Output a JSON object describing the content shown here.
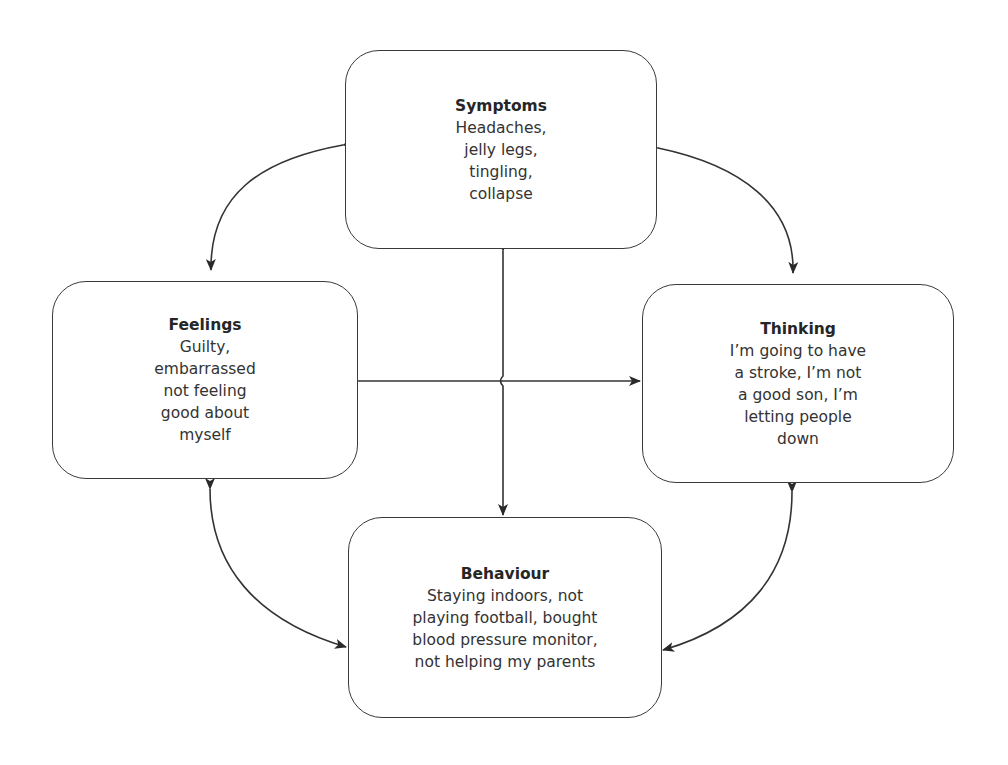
{
  "diagram": {
    "type": "cognitive-behavioural cycle",
    "nodes": [
      {
        "id": "symptoms",
        "title": "Symptoms",
        "body": "Headaches,\njelly legs,\ntingling,\ncollapse"
      },
      {
        "id": "feelings",
        "title": "Feelings",
        "body": "Guilty,\nembarrassed\nnot feeling\ngood about\nmyself"
      },
      {
        "id": "thinking",
        "title": "Thinking",
        "body": "I’m going to have\na stroke, I’m not\na good son, I’m\nletting people\ndown"
      },
      {
        "id": "behaviour",
        "title": "Behaviour",
        "body": "Staying indoors, not\nplaying football, bought\nblood pressure monitor,\nnot helping my parents"
      }
    ],
    "edges": [
      {
        "from": "symptoms",
        "to": "feelings",
        "style": "curved",
        "bidirectional": true
      },
      {
        "from": "symptoms",
        "to": "thinking",
        "style": "curved",
        "bidirectional": true
      },
      {
        "from": "feelings",
        "to": "behaviour",
        "style": "curved",
        "bidirectional": true
      },
      {
        "from": "thinking",
        "to": "behaviour",
        "style": "curved",
        "bidirectional": true
      },
      {
        "from": "symptoms",
        "to": "behaviour",
        "style": "straight",
        "bidirectional": true
      },
      {
        "from": "feelings",
        "to": "thinking",
        "style": "straight",
        "bidirectional": true
      }
    ],
    "colors": {
      "line": "#333333",
      "border": "#3a3a3a",
      "background": "#ffffff"
    }
  }
}
